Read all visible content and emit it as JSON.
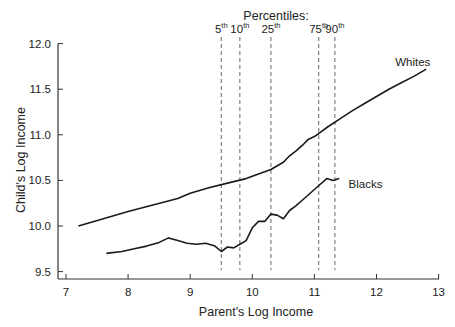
{
  "chart_data": {
    "type": "line",
    "title": "",
    "xlabel": "Parent's Log Income",
    "ylabel": "Child's Log Income",
    "xlim": [
      6.9,
      13
    ],
    "ylim": [
      9.4,
      12.0
    ],
    "x_ticks": [
      7,
      8,
      9,
      10,
      11,
      12,
      13
    ],
    "x_tick_labels": [
      "7",
      "8",
      "9",
      "10",
      "11",
      "12",
      "13"
    ],
    "y_ticks": [
      9.5,
      10.0,
      10.5,
      11.0,
      11.5,
      12.0
    ],
    "y_tick_labels": [
      "9.5",
      "10.0",
      "10.5",
      "11.0",
      "11.5",
      "12.0"
    ],
    "grid": false,
    "legend_position": "inline labels",
    "annotation_title": "Percentiles:",
    "percentiles": [
      {
        "label": "5",
        "sup": "th",
        "x": 9.5
      },
      {
        "label": "10",
        "sup": "th",
        "x": 9.8
      },
      {
        "label": "25",
        "sup": "th",
        "x": 10.3
      },
      {
        "label": "75",
        "sup": "th",
        "x": 11.07
      },
      {
        "label": "90",
        "sup": "th",
        "x": 11.33
      }
    ],
    "series": [
      {
        "name": "Whites",
        "label_pos": {
          "x": 12.3,
          "y": 11.75
        },
        "x": [
          7.2,
          7.6,
          8.0,
          8.4,
          8.8,
          9.0,
          9.3,
          9.6,
          9.9,
          10.1,
          10.3,
          10.5,
          10.6,
          10.7,
          10.8,
          10.9,
          11.0,
          11.1,
          11.2,
          11.4,
          11.6,
          11.8,
          12.0,
          12.2,
          12.4,
          12.6,
          12.8
        ],
        "values": [
          10.0,
          10.08,
          10.16,
          10.23,
          10.3,
          10.36,
          10.42,
          10.47,
          10.52,
          10.57,
          10.62,
          10.7,
          10.77,
          10.82,
          10.88,
          10.95,
          10.98,
          11.03,
          11.08,
          11.17,
          11.26,
          11.34,
          11.42,
          11.5,
          11.57,
          11.64,
          11.72
        ]
      },
      {
        "name": "Blacks",
        "label_pos": {
          "x": 11.55,
          "y": 10.42
        },
        "x": [
          7.65,
          7.9,
          8.1,
          8.3,
          8.5,
          8.65,
          8.8,
          8.95,
          9.1,
          9.25,
          9.4,
          9.5,
          9.6,
          9.7,
          9.8,
          9.9,
          10.0,
          10.1,
          10.2,
          10.3,
          10.4,
          10.5,
          10.6,
          10.7,
          10.8,
          10.9,
          11.0,
          11.1,
          11.2,
          11.3,
          11.4
        ],
        "values": [
          9.7,
          9.72,
          9.75,
          9.78,
          9.82,
          9.87,
          9.84,
          9.81,
          9.8,
          9.81,
          9.78,
          9.72,
          9.77,
          9.76,
          9.8,
          9.84,
          9.98,
          10.05,
          10.05,
          10.13,
          10.12,
          10.08,
          10.17,
          10.22,
          10.28,
          10.34,
          10.4,
          10.46,
          10.52,
          10.5,
          10.52
        ]
      }
    ]
  }
}
